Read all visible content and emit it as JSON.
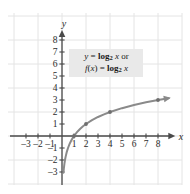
{
  "figure": {
    "background_color": "#ffffff",
    "grid_color": "#e4e4e4",
    "axis_color": "#4a4a4a",
    "curve_color": "#8a8a8a",
    "label_bg_color": "#e9e9e9",
    "text_color": "#2b2b2b"
  },
  "equation_label": {
    "line1": {
      "lhs": "y",
      "equals": "=",
      "fn": "log",
      "base": "2",
      "arg": "x",
      "suffix": "or"
    },
    "line2": {
      "lhs_fn": "f",
      "lhs_open": "(",
      "lhs_var": "x",
      "lhs_close": ")",
      "equals": "=",
      "fn": "log",
      "base": "2",
      "arg": "x"
    }
  },
  "chart_data": {
    "type": "line",
    "title": "",
    "subtitle": "",
    "xlabel": "x",
    "ylabel": "y",
    "function": "y = log_2 x",
    "annotations": [
      "y = log₂ x or",
      "f(x) = log₂ x"
    ],
    "legend": [],
    "legend_position": "none",
    "grid": true,
    "grid_step": 2,
    "xlim": [
      -3.9,
      9.4
    ],
    "ylim": [
      -3.9,
      8.8
    ],
    "xticks": [
      -3,
      -2,
      -1,
      1,
      2,
      3,
      4,
      5,
      6,
      7,
      8
    ],
    "xtick_labels": [
      "–3",
      "–2",
      "–1",
      "1",
      "2",
      "3",
      "4",
      "5",
      "6",
      "7",
      "8"
    ],
    "yticks": [
      -3,
      -2,
      -1,
      1,
      2,
      3,
      4,
      5,
      6,
      7,
      8
    ],
    "ytick_labels": [
      "–3",
      "–2",
      "–1",
      "1",
      "2",
      "3",
      "4",
      "5",
      "6",
      "7",
      "8"
    ],
    "series": [
      {
        "name": "y = log_2 x",
        "color": "#8a8a8a",
        "arrow_end": true,
        "x": [
          0.12,
          0.15,
          0.2,
          0.25,
          0.3,
          0.4,
          0.5,
          0.625,
          0.75,
          0.875,
          1.0,
          1.25,
          1.5,
          1.75,
          2.0,
          2.5,
          3.0,
          3.5,
          4.0,
          5.0,
          6.0,
          7.0,
          8.0,
          8.9
        ],
        "y": [
          -3.06,
          -2.74,
          -2.32,
          -2.0,
          -1.74,
          -1.32,
          -1.0,
          -0.68,
          -0.415,
          -0.193,
          0.0,
          0.32,
          0.585,
          0.807,
          1.0,
          1.32,
          1.585,
          1.807,
          2.0,
          2.32,
          2.585,
          2.807,
          3.0,
          3.154
        ],
        "markers": [
          {
            "x": 1,
            "y": 0
          },
          {
            "x": 2,
            "y": 1
          },
          {
            "x": 4,
            "y": 2
          },
          {
            "x": 8,
            "y": 3
          }
        ]
      }
    ]
  }
}
